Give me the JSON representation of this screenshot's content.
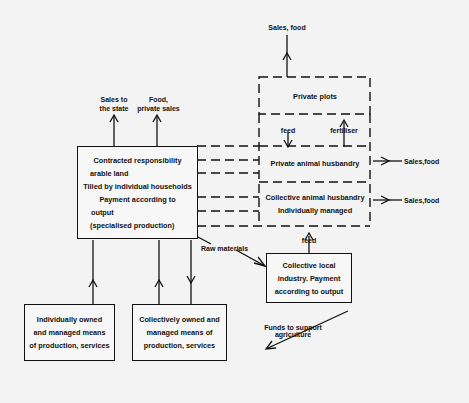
{
  "diagram": {
    "boxes": {
      "contracted": {
        "lines": [
          "Contracted responsibility",
          "arable land",
          "Tilled by individual households",
          "Payment according to",
          "output",
          "(specialised production)"
        ]
      },
      "private_plots": {
        "lines": [
          "Private plots"
        ]
      },
      "private_animal": {
        "lines": [
          "Private animal husbandry"
        ]
      },
      "collective_animal": {
        "lines": [
          "Collective animal husbandry",
          "Individually managed"
        ]
      },
      "collective_industry": {
        "lines": [
          "Collective local",
          "industry. Payment",
          "according to output"
        ]
      },
      "individual_means": {
        "lines": [
          "Individually owned",
          "and managed means",
          "of production, services"
        ]
      },
      "collective_means": {
        "lines": [
          "Collectively owned and",
          "managed means of",
          "production, services"
        ]
      }
    },
    "labels": {
      "sales_to_state": [
        "Sales to",
        "the state"
      ],
      "food_private_sales": [
        "Food,",
        "private sales"
      ],
      "sales_food_top": "Sales, food",
      "feed_top": "feed",
      "fertiliser": "fertiliser",
      "sales_food_right_1": "Sales,food",
      "sales_food_right_2": "Sales,food",
      "feed_bottom": "feed",
      "raw_materials": "Raw materials",
      "funds": [
        "Funds to support",
        "agriculture"
      ]
    },
    "edges": [
      {
        "from": "contracted",
        "to": "Sales to the state",
        "style": "solid"
      },
      {
        "from": "contracted",
        "to": "Food, private sales",
        "style": "solid"
      },
      {
        "from": "private_plots",
        "to": "Sales, food",
        "style": "solid"
      },
      {
        "from": "private_plots",
        "to": "private_animal",
        "label": "feed",
        "style": "solid"
      },
      {
        "from": "private_animal",
        "to": "private_plots",
        "label": "fertiliser",
        "style": "solid"
      },
      {
        "from": "private_animal",
        "to": "Sales,food",
        "style": "solid"
      },
      {
        "from": "collective_animal",
        "to": "Sales,food",
        "style": "solid"
      },
      {
        "from": "collective_industry",
        "to": "collective_animal",
        "label": "feed",
        "style": "solid"
      },
      {
        "from": "contracted",
        "to": "collective_industry",
        "label": "Raw materials",
        "style": "solid"
      },
      {
        "from": "collective_industry",
        "to": "collective_means",
        "label": "Funds to support agriculture",
        "style": "solid"
      },
      {
        "from": "individual_means",
        "to": "contracted",
        "style": "solid"
      },
      {
        "from": "collective_means",
        "to": "contracted",
        "style": "solid"
      },
      {
        "from": "contracted",
        "to": "collective_means",
        "style": "solid"
      },
      {
        "from": "contracted",
        "to": "private/collective animal husbandry",
        "style": "dashed"
      }
    ]
  }
}
